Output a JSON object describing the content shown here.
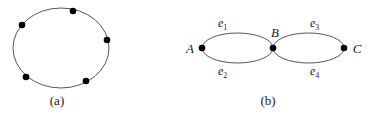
{
  "diagram_a": {
    "caption": "(a)",
    "ellipse": {
      "cx": 61,
      "cy": 48,
      "rx": 48,
      "ry": 40
    },
    "vertices": [
      {
        "x": 73,
        "y": 11
      },
      {
        "x": 22,
        "y": 25
      },
      {
        "x": 107,
        "y": 40
      },
      {
        "x": 26,
        "y": 77
      },
      {
        "x": 86,
        "y": 81
      }
    ]
  },
  "diagram_b": {
    "caption": "(b)",
    "vertices": [
      {
        "id": "A",
        "label": "A",
        "x": 202,
        "y": 48
      },
      {
        "id": "B",
        "label": "B",
        "x": 273,
        "y": 48
      },
      {
        "id": "C",
        "label": "C",
        "x": 344,
        "y": 48
      }
    ],
    "edges": [
      {
        "id": "e1",
        "base": "e",
        "sub": "1",
        "from": "A",
        "to": "B",
        "side": "top"
      },
      {
        "id": "e2",
        "base": "e",
        "sub": "2",
        "from": "A",
        "to": "B",
        "side": "bottom"
      },
      {
        "id": "e3",
        "base": "e",
        "sub": "3",
        "from": "B",
        "to": "C",
        "side": "top"
      },
      {
        "id": "e4",
        "base": "e",
        "sub": "4",
        "from": "B",
        "to": "C",
        "side": "bottom"
      }
    ]
  },
  "colors": {
    "stroke": "#555555",
    "vertex": "#000000",
    "text": "#1a1a1a"
  }
}
